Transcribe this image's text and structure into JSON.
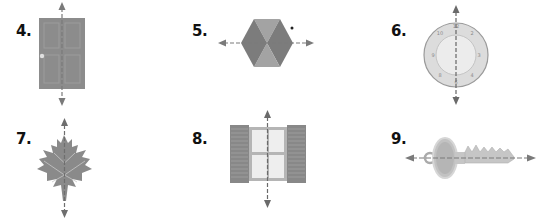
{
  "items": [
    {
      "number": "4.",
      "object": "door",
      "icon": "door-icon",
      "line_of_symmetry": "vertical"
    },
    {
      "number": "5.",
      "object": "hexagon",
      "icon": "hexagon-icon",
      "line_of_symmetry": "horizontal"
    },
    {
      "number": "6.",
      "object": "clock-face",
      "icon": "clock-icon",
      "line_of_symmetry": "vertical"
    },
    {
      "number": "7.",
      "object": "maple-leaf",
      "icon": "maple-leaf-icon",
      "line_of_symmetry": "vertical"
    },
    {
      "number": "8.",
      "object": "window-with-shutters",
      "icon": "window-icon",
      "line_of_symmetry": "vertical"
    },
    {
      "number": "9.",
      "object": "key",
      "icon": "key-icon",
      "line_of_symmetry": "horizontal"
    }
  ],
  "colors": {
    "figure_fill": "#8a8a8a",
    "figure_light": "#b0b0b0",
    "figure_dark": "#6e6e6e",
    "arrow": "#777777",
    "label": "#111111"
  }
}
